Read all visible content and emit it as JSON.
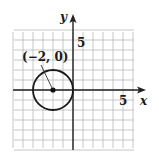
{
  "diagram": {
    "type": "coordinate-plane-circle",
    "axes": {
      "x_label": "x",
      "y_label": "y",
      "x_tick_label": "5",
      "y_tick_label": "5",
      "x_range": [
        -6,
        6
      ],
      "y_range": [
        -6,
        6
      ],
      "grid": true
    },
    "circle": {
      "center": [
        -2,
        0
      ],
      "radius": 2
    },
    "annotation": {
      "text": "(−2, 0)",
      "points_to": [
        -2,
        0
      ]
    },
    "colors": {
      "grid": "#b8b8b8",
      "axis": "#222222",
      "curve": "#1a1a1a",
      "background": "#ffffff"
    }
  }
}
